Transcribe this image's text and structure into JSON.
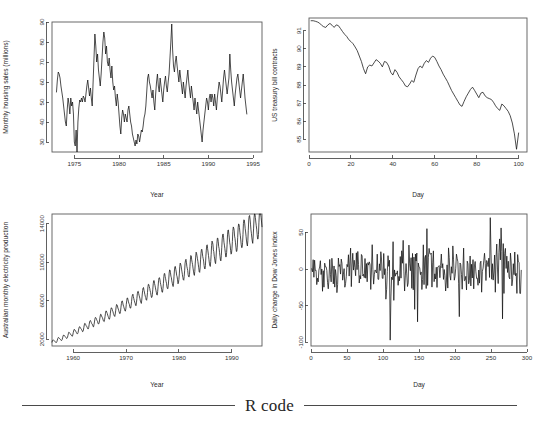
{
  "figure": {
    "caption": "R code",
    "panel_count": 4
  },
  "chart_data": [
    {
      "type": "line",
      "panel": "top-left",
      "title": "",
      "xlabel": "Year",
      "ylabel": "Monthly housing sales (millions)",
      "xlim": [
        1972.5,
        1996.0
      ],
      "ylim": [
        25,
        90
      ],
      "xticks": [
        1975,
        1980,
        1985,
        1990,
        1995
      ],
      "yticks": [
        30,
        40,
        50,
        60,
        70,
        80,
        90
      ],
      "grid": false,
      "legend": null,
      "x": [
        1973.0,
        1973.1,
        1973.2,
        1973.3,
        1973.4,
        1973.5,
        1973.6,
        1973.7,
        1973.8,
        1973.9,
        1974.0,
        1974.1,
        1974.2,
        1974.3,
        1974.4,
        1974.5,
        1974.6,
        1974.7,
        1974.8,
        1974.9,
        1975.0,
        1975.1,
        1975.2,
        1975.3,
        1975.4,
        1975.5,
        1975.6,
        1975.7,
        1975.8,
        1975.9,
        1976.0,
        1976.1,
        1976.2,
        1976.3,
        1976.4,
        1976.5,
        1976.6,
        1976.7,
        1976.8,
        1976.9,
        1977.0,
        1977.1,
        1977.2,
        1977.3,
        1977.4,
        1977.5,
        1977.6,
        1977.7,
        1977.8,
        1977.9,
        1978.0,
        1978.1,
        1978.2,
        1978.3,
        1978.4,
        1978.5,
        1978.6,
        1978.7,
        1978.8,
        1978.9,
        1979.0,
        1979.1,
        1979.2,
        1979.3,
        1979.4,
        1979.5,
        1979.6,
        1979.7,
        1979.8,
        1979.9,
        1980.0,
        1980.1,
        1980.2,
        1980.3,
        1980.4,
        1980.5,
        1980.6,
        1980.7,
        1980.8,
        1980.9,
        1981.0,
        1981.1,
        1981.2,
        1981.3,
        1981.4,
        1981.5,
        1981.6,
        1981.7,
        1981.8,
        1981.9,
        1982.0,
        1982.1,
        1982.2,
        1982.3,
        1982.4,
        1982.5,
        1982.6,
        1982.7,
        1982.8,
        1982.9,
        1983.0,
        1983.1,
        1983.2,
        1983.3,
        1983.4,
        1983.5,
        1983.6,
        1983.7,
        1983.8,
        1983.9,
        1984.0,
        1984.1,
        1984.2,
        1984.3,
        1984.4,
        1984.5,
        1984.6,
        1984.7,
        1984.8,
        1984.9,
        1985.0,
        1985.1,
        1985.2,
        1985.3,
        1985.4,
        1985.5,
        1985.6,
        1985.7,
        1985.8,
        1985.9,
        1986.0,
        1986.1,
        1986.2,
        1986.3,
        1986.4,
        1986.5,
        1986.6,
        1986.7,
        1986.8,
        1986.9,
        1987.0,
        1987.1,
        1987.2,
        1987.3,
        1987.4,
        1987.5,
        1987.6,
        1987.7,
        1987.8,
        1987.9,
        1988.0,
        1988.1,
        1988.2,
        1988.3,
        1988.4,
        1988.5,
        1988.6,
        1988.7,
        1988.8,
        1988.9,
        1989.0,
        1989.1,
        1989.2,
        1989.3,
        1989.4,
        1989.5,
        1989.6,
        1989.7,
        1989.8,
        1989.9,
        1990.0,
        1990.1,
        1990.2,
        1990.3,
        1990.4,
        1990.5,
        1990.6,
        1990.7,
        1990.8,
        1990.9,
        1991.0,
        1991.1,
        1991.2,
        1991.3,
        1991.4,
        1991.5,
        1991.6,
        1991.7,
        1991.8,
        1991.9,
        1992.0,
        1992.1,
        1992.2,
        1992.3,
        1992.4,
        1992.5,
        1992.6,
        1992.7,
        1992.8,
        1992.9,
        1993.0,
        1993.1,
        1993.2,
        1993.3,
        1993.4,
        1993.5,
        1993.6,
        1993.7,
        1993.8,
        1993.9,
        1994.0,
        1994.1,
        1994.2,
        1994.3,
        1994.4,
        1994.5,
        1994.6,
        1994.7,
        1994.8,
        1994.9,
        1995.0,
        1995.1,
        1995.2,
        1995.3,
        1995.4,
        1995.5,
        1995.6,
        1995.7
      ],
      "values": [
        55,
        61,
        65,
        64,
        62,
        58,
        55,
        52,
        48,
        44,
        40,
        38,
        46,
        52,
        49,
        44,
        52,
        48,
        50,
        44,
        30,
        28,
        36,
        24,
        40,
        47,
        51,
        50,
        52,
        50,
        53,
        52,
        50,
        54,
        58,
        61,
        57,
        53,
        57,
        52,
        48,
        60,
        72,
        84,
        78,
        70,
        74,
        66,
        62,
        58,
        64,
        72,
        80,
        85,
        82,
        74,
        78,
        70,
        68,
        72,
        66,
        62,
        68,
        60,
        56,
        58,
        52,
        48,
        54,
        50,
        44,
        38,
        34,
        42,
        46,
        44,
        40,
        44,
        42,
        40,
        46,
        48,
        44,
        40,
        38,
        34,
        32,
        30,
        28,
        31,
        29,
        34,
        33,
        30,
        33,
        36,
        35,
        38,
        42,
        44,
        48,
        55,
        62,
        64,
        60,
        58,
        55,
        52,
        56,
        50,
        46,
        54,
        60,
        64,
        58,
        55,
        62,
        58,
        54,
        50,
        56,
        60,
        63,
        58,
        55,
        60,
        64,
        72,
        80,
        89,
        76,
        68,
        65,
        70,
        73,
        68,
        64,
        60,
        66,
        62,
        58,
        54,
        60,
        56,
        52,
        58,
        62,
        66,
        60,
        56,
        52,
        58,
        54,
        50,
        46,
        52,
        48,
        44,
        50,
        46,
        42,
        38,
        34,
        30,
        36,
        40,
        44,
        48,
        52,
        50,
        46,
        52,
        54,
        50,
        54,
        52,
        48,
        54,
        50,
        46,
        52,
        56,
        60,
        58,
        54,
        50,
        56,
        62,
        66,
        62,
        58,
        54,
        58,
        62,
        74,
        66,
        60,
        56,
        52,
        48,
        54,
        58,
        62,
        64,
        60,
        56,
        52,
        56,
        60,
        64,
        58,
        52,
        48,
        44
      ]
    },
    {
      "type": "line",
      "panel": "top-right",
      "title": "",
      "xlabel": "Day",
      "ylabel": "US treasury bill contracts",
      "xlim": [
        0,
        104
      ],
      "ylim": [
        84.3,
        91.7
      ],
      "xticks": [
        0,
        20,
        40,
        60,
        80,
        100
      ],
      "yticks": [
        85,
        86,
        87,
        88,
        89,
        90,
        91
      ],
      "grid": false,
      "legend": null,
      "x": [
        1,
        2,
        3,
        4,
        5,
        6,
        7,
        8,
        9,
        10,
        11,
        12,
        13,
        14,
        15,
        16,
        17,
        18,
        19,
        20,
        21,
        22,
        23,
        24,
        25,
        26,
        27,
        28,
        29,
        30,
        31,
        32,
        33,
        34,
        35,
        36,
        37,
        38,
        39,
        40,
        41,
        42,
        43,
        44,
        45,
        46,
        47,
        48,
        49,
        50,
        51,
        52,
        53,
        54,
        55,
        56,
        57,
        58,
        59,
        60,
        61,
        62,
        63,
        64,
        65,
        66,
        67,
        68,
        69,
        70,
        71,
        72,
        73,
        74,
        75,
        76,
        77,
        78,
        79,
        80,
        81,
        82,
        83,
        84,
        85,
        86,
        87,
        88,
        89,
        90,
        91,
        92,
        93,
        94,
        95,
        96,
        97,
        98,
        99,
        100
      ],
      "values": [
        91.55,
        91.55,
        91.52,
        91.48,
        91.42,
        91.3,
        91.22,
        91.18,
        91.32,
        91.4,
        91.3,
        91.18,
        91.32,
        91.28,
        91.12,
        90.95,
        90.8,
        90.68,
        90.5,
        90.4,
        90.28,
        90.1,
        89.9,
        89.6,
        89.3,
        88.9,
        88.62,
        89.0,
        89.1,
        89.05,
        89.22,
        89.4,
        89.32,
        89.2,
        89.0,
        89.3,
        89.25,
        89.05,
        88.7,
        88.55,
        88.85,
        88.7,
        88.45,
        88.3,
        88.15,
        87.95,
        87.9,
        88.05,
        88.25,
        88.15,
        88.55,
        88.9,
        89.05,
        88.95,
        89.2,
        89.35,
        89.25,
        89.48,
        89.6,
        89.52,
        89.3,
        89.05,
        88.85,
        88.6,
        88.4,
        88.2,
        87.95,
        87.7,
        87.5,
        87.3,
        87.1,
        86.9,
        86.82,
        87.1,
        87.35,
        87.55,
        87.75,
        87.88,
        87.7,
        87.5,
        87.3,
        87.55,
        87.6,
        87.4,
        87.3,
        87.25,
        87.2,
        87.05,
        86.85,
        86.7,
        86.6,
        86.95,
        86.85,
        86.7,
        86.55,
        86.3,
        85.9,
        85.3,
        84.45,
        85.35
      ]
    },
    {
      "type": "line",
      "panel": "bottom-left",
      "title": "",
      "xlabel": "Year",
      "ylabel": "Australian monthly electricity production",
      "xlim": [
        1956.0,
        1995.7
      ],
      "ylim": [
        1300,
        15000
      ],
      "xticks": [
        1960,
        1970,
        1980,
        1990
      ],
      "yticks": [
        2000,
        6000,
        10000,
        14000
      ],
      "grid": false,
      "legend": null,
      "description": "Strongly increasing trend with regular annual seasonal oscillation; amplitude grows with level",
      "trend_start": 1700,
      "trend_end": 14200,
      "seasonal_period_years": 1.0,
      "seasonal_amplitude_start": 180,
      "seasonal_amplitude_end": 1500
    },
    {
      "type": "line",
      "panel": "bottom-right",
      "title": "",
      "xlabel": "Day",
      "ylabel": "Daily change in Dow Jones index",
      "xlim": [
        0,
        300
      ],
      "ylim": [
        -105,
        75
      ],
      "xticks": [
        0,
        50,
        100,
        150,
        200,
        250,
        300
      ],
      "yticks": [
        -100,
        -50,
        0,
        50
      ],
      "grid": false,
      "legend": null,
      "description": "White-noise-like daily differences centred on zero with a few large negative spikes near days 110 and 148",
      "mean": 0,
      "typical_range": [
        -30,
        30
      ],
      "outliers": [
        {
          "x": 110,
          "y": -97
        },
        {
          "x": 148,
          "y": -72
        },
        {
          "x": 144,
          "y": -55
        },
        {
          "x": 206,
          "y": -65
        },
        {
          "x": 266,
          "y": -68
        },
        {
          "x": 249,
          "y": 70
        },
        {
          "x": 161,
          "y": 55
        },
        {
          "x": 264,
          "y": 56
        }
      ]
    }
  ]
}
